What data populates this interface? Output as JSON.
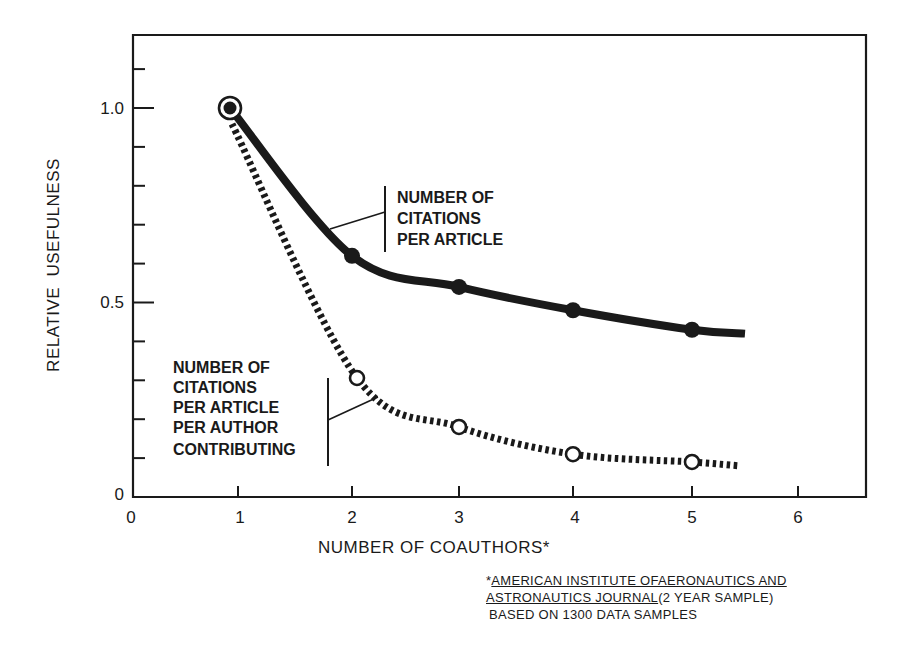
{
  "chart_data": {
    "type": "line",
    "title": "",
    "xlabel": "NUMBER OF COAUTHORS*",
    "ylabel": "RELATIVE  USEFULNESS",
    "xlim": [
      0,
      6.4
    ],
    "ylim": [
      0,
      1.2
    ],
    "x_ticks": [
      "0",
      "1",
      "2",
      "3",
      "4",
      "5",
      "6"
    ],
    "y_ticks": [
      "0",
      "0.5",
      "1.0"
    ],
    "y_minor_step": 0.1,
    "grid": false,
    "legend_position": "inline-annotations",
    "x": [
      1,
      2,
      3,
      4,
      5
    ],
    "series": [
      {
        "name": "NUMBER OF CITATIONS PER ARTICLE",
        "label_lines": [
          "NUMBER OF",
          "CITATIONS",
          "PER ARTICLE"
        ],
        "style": "solid",
        "marker": "filled-circle",
        "values": [
          1.0,
          0.62,
          0.54,
          0.48,
          0.43
        ],
        "curve_extends_to_x": 5.5,
        "curve_end_value": 0.42
      },
      {
        "name": "NUMBER OF CITATIONS PER ARTICLE PER AUTHOR CONTRIBUTING",
        "label_lines": [
          "NUMBER OF",
          "CITATIONS",
          "PER ARTICLE",
          "PER AUTHOR",
          "CONTRIBUTING"
        ],
        "style": "dashed",
        "marker": "open-circle",
        "values": [
          1.0,
          0.31,
          0.18,
          0.11,
          0.09
        ],
        "curve_extends_to_x": 5.45,
        "curve_end_value": 0.08
      }
    ],
    "footnote": {
      "line1_marker": "*",
      "line1_underlined": "AMERICAN INSTITUTE OFAERONAUTICS AND",
      "line2_underlined": "ASTRONAUTICS JOURNAL",
      "line2_rest": "(2 YEAR SAMPLE)",
      "line3": "BASED ON 1300 DATA SAMPLES"
    }
  },
  "colors": {
    "ink": "#1a1a1a",
    "background": "#ffffff"
  }
}
